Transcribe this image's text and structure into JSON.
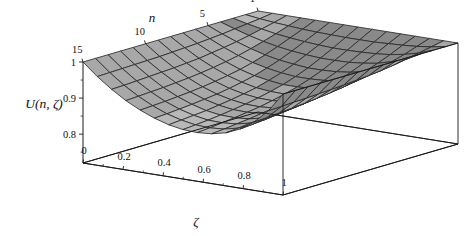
{
  "figure": {
    "kind": "mathematica-3d-surface-plot",
    "background": "#ffffff",
    "surface_color_light": "#b8b8b8",
    "surface_color_mid": "#a8a8a8",
    "surface_color_dark": "#8a8a8a",
    "mesh_color": "#2b2b2b",
    "axis_color": "#1a1a1a"
  },
  "chart_data": {
    "type": "surface",
    "title": "",
    "zlabel": "U(n, ζ)",
    "xlabel": "ζ",
    "ylabel": "n",
    "grid": true,
    "legend": "none",
    "xlim": [
      0,
      1
    ],
    "ylim": [
      15,
      1
    ],
    "zlim": [
      0.72,
      1.0
    ],
    "xticks": [
      "0",
      "0.2",
      "0.4",
      "0.6",
      "0.8",
      "1"
    ],
    "xtick_values": [
      0,
      0.2,
      0.4,
      0.6,
      0.8,
      1
    ],
    "yticks": [
      "15",
      "10",
      "5",
      "1"
    ],
    "ytick_values": [
      15,
      10,
      5,
      1
    ],
    "zticks": [
      "0.8",
      "0.9",
      "1"
    ],
    "ztick_values": [
      0.8,
      0.9,
      1.0
    ],
    "x": [
      0,
      0.0714,
      0.1429,
      0.2143,
      0.2857,
      0.3571,
      0.4286,
      0.5,
      0.5714,
      0.6429,
      0.7143,
      0.7857,
      0.8571,
      0.9286,
      1
    ],
    "y": [
      15,
      14,
      13,
      12,
      11,
      10,
      9,
      8,
      7,
      6,
      5,
      4,
      3,
      2,
      1
    ],
    "annotations": [],
    "z": [
      [
        1.0,
        0.966,
        0.937,
        0.912,
        0.892,
        0.876,
        0.864,
        0.857,
        0.855,
        0.858,
        0.867,
        0.884,
        0.91,
        0.948,
        1.0
      ],
      [
        1.0,
        0.967,
        0.938,
        0.914,
        0.894,
        0.878,
        0.867,
        0.86,
        0.858,
        0.861,
        0.87,
        0.887,
        0.912,
        0.949,
        1.0
      ],
      [
        1.0,
        0.968,
        0.94,
        0.916,
        0.896,
        0.881,
        0.87,
        0.863,
        0.862,
        0.865,
        0.874,
        0.89,
        0.915,
        0.951,
        1.0
      ],
      [
        1.0,
        0.969,
        0.942,
        0.918,
        0.899,
        0.884,
        0.873,
        0.867,
        0.866,
        0.869,
        0.878,
        0.894,
        0.918,
        0.952,
        1.0
      ],
      [
        1.0,
        0.97,
        0.944,
        0.921,
        0.902,
        0.888,
        0.878,
        0.872,
        0.871,
        0.874,
        0.882,
        0.898,
        0.921,
        0.954,
        1.0
      ],
      [
        1.0,
        0.971,
        0.946,
        0.924,
        0.906,
        0.892,
        0.883,
        0.877,
        0.876,
        0.879,
        0.887,
        0.902,
        0.925,
        0.956,
        1.0
      ],
      [
        1.0,
        0.973,
        0.949,
        0.928,
        0.911,
        0.898,
        0.889,
        0.884,
        0.883,
        0.886,
        0.894,
        0.908,
        0.929,
        0.958,
        1.0
      ],
      [
        1.0,
        0.975,
        0.952,
        0.933,
        0.917,
        0.905,
        0.896,
        0.892,
        0.891,
        0.894,
        0.901,
        0.914,
        0.934,
        0.961,
        1.0
      ],
      [
        1.0,
        0.977,
        0.957,
        0.939,
        0.924,
        0.913,
        0.906,
        0.901,
        0.901,
        0.903,
        0.91,
        0.922,
        0.94,
        0.964,
        1.0
      ],
      [
        1.0,
        0.98,
        0.962,
        0.946,
        0.933,
        0.924,
        0.917,
        0.913,
        0.913,
        0.915,
        0.921,
        0.931,
        0.947,
        0.968,
        1.0
      ],
      [
        1.0,
        0.983,
        0.968,
        0.955,
        0.944,
        0.936,
        0.931,
        0.927,
        0.927,
        0.929,
        0.934,
        0.942,
        0.956,
        0.973,
        1.0
      ],
      [
        1.0,
        0.987,
        0.975,
        0.965,
        0.957,
        0.951,
        0.947,
        0.944,
        0.944,
        0.945,
        0.949,
        0.955,
        0.966,
        0.979,
        1.0
      ],
      [
        1.0,
        0.991,
        0.983,
        0.976,
        0.971,
        0.967,
        0.964,
        0.962,
        0.962,
        0.963,
        0.965,
        0.969,
        0.976,
        0.986,
        1.0
      ],
      [
        1.0,
        0.995,
        0.991,
        0.988,
        0.985,
        0.983,
        0.982,
        0.981,
        0.981,
        0.981,
        0.983,
        0.985,
        0.988,
        0.993,
        1.0
      ],
      [
        1.0,
        1.0,
        1.0,
        1.0,
        1.0,
        1.0,
        1.0,
        1.0,
        1.0,
        1.0,
        1.0,
        1.0,
        1.0,
        1.0,
        1.0
      ]
    ]
  }
}
